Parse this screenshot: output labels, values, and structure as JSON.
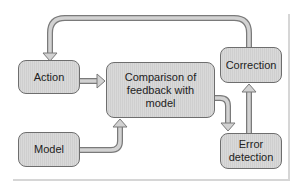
{
  "diagram": {
    "type": "flowchart",
    "nodes": {
      "action": {
        "label": "Action"
      },
      "comparison": {
        "label": "Comparison of feedback with model",
        "lines": [
          "Comparison of",
          "feedback with",
          "model"
        ]
      },
      "correction": {
        "label": "Correction"
      },
      "model": {
        "label": "Model"
      },
      "error_detection": {
        "label": "Error detection",
        "lines": [
          "Error",
          "detection"
        ]
      }
    },
    "edges": [
      {
        "from": "Action",
        "to": "Comparison of feedback with model"
      },
      {
        "from": "Model",
        "to": "Comparison of feedback with model"
      },
      {
        "from": "Comparison of feedback with model",
        "to": "Error detection"
      },
      {
        "from": "Error detection",
        "to": "Correction"
      },
      {
        "from": "Correction",
        "to": "Action"
      }
    ],
    "colors": {
      "box_fill": "#d4d4d4",
      "box_border": "#6e6e6e",
      "arrow_fill": "#cfcfcf",
      "arrow_stroke": "#7a7a7a",
      "frame": "#d6d6d6"
    }
  }
}
